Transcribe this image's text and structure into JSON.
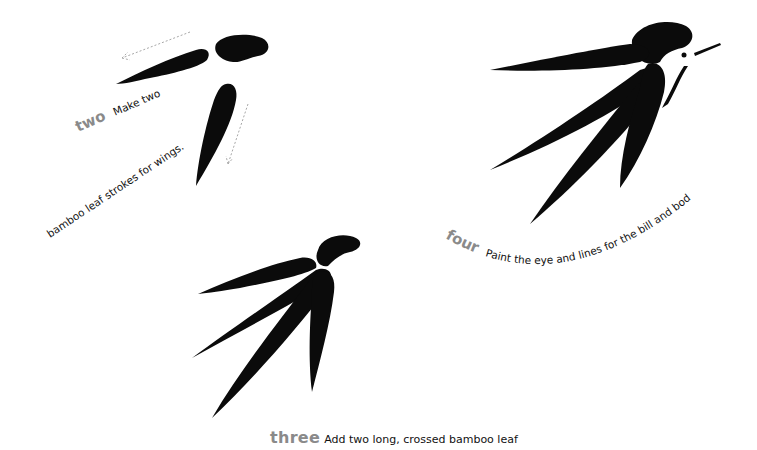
{
  "steps": {
    "two": {
      "label": "two",
      "text_line1": "Make two",
      "text_line2": "bamboo leaf strokes for wings."
    },
    "three": {
      "label": "three",
      "text": "Add two long, crossed bamboo leaf"
    },
    "four": {
      "label": "four",
      "text": "Paint the eye and lines for the bill and body."
    }
  },
  "colors": {
    "ink": "#0b0b0b",
    "step_label": "#8a8a8a",
    "arrow": "#a8a8a8",
    "background": "#ffffff"
  }
}
